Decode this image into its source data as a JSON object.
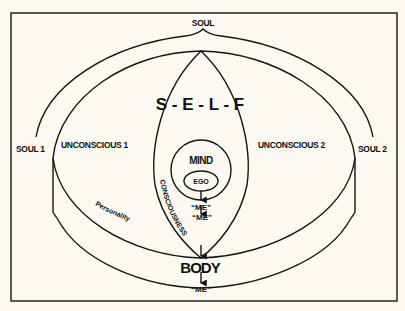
{
  "diagram": {
    "labels": {
      "soul": "SOUL",
      "soul1": "SOUL 1",
      "soul2": "SOUL 2",
      "self": "S - E - L - F",
      "unconscious1": "UNCONSCIOUS 1",
      "unconscious2": "UNCONSCIOUS 2",
      "mind": "MIND",
      "ego": "EGO",
      "me_mind": "“ME”",
      "me_middle": "“ME”",
      "consciousness": "CONSCIOUSNESS",
      "personality": "Personality",
      "body": "BODY",
      "me_body": "“ME”"
    },
    "colors": {
      "background": "#fbf9f0",
      "ink": "#151515"
    }
  }
}
